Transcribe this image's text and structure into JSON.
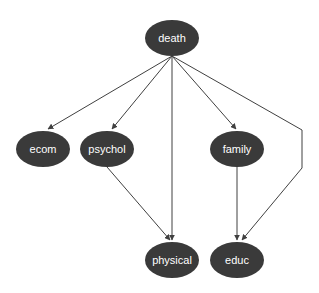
{
  "diagram": {
    "type": "directed-graph",
    "colors": {
      "node_fill": "#3a3a3a",
      "node_text": "#ffffff",
      "edge": "#404040",
      "background": "#ffffff"
    },
    "nodes": [
      {
        "id": "death",
        "label": "death",
        "cx": 172,
        "cy": 38
      },
      {
        "id": "ecom",
        "label": "ecom",
        "cx": 43,
        "cy": 149
      },
      {
        "id": "psychol",
        "label": "psychol",
        "cx": 107,
        "cy": 149
      },
      {
        "id": "family",
        "label": "family",
        "cx": 237,
        "cy": 149
      },
      {
        "id": "physical",
        "label": "physical",
        "cx": 172,
        "cy": 260
      },
      {
        "id": "educ",
        "label": "educ",
        "cx": 237,
        "cy": 260
      }
    ],
    "edges": [
      {
        "from": "death",
        "to": "ecom"
      },
      {
        "from": "death",
        "to": "psychol"
      },
      {
        "from": "death",
        "to": "physical"
      },
      {
        "from": "death",
        "to": "family"
      },
      {
        "from": "death",
        "to": "educ",
        "via": [
          [
            302,
            130
          ],
          [
            302,
            168
          ]
        ]
      },
      {
        "from": "psychol",
        "to": "physical"
      },
      {
        "from": "family",
        "to": "educ"
      }
    ]
  }
}
